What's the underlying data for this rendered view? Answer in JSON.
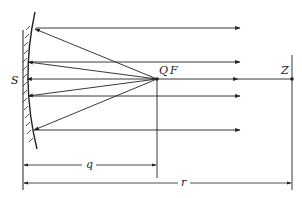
{
  "diagram": {
    "labels": {
      "mirror": "S",
      "focus_q": "Q",
      "focus_f": "F",
      "point_z": "Z",
      "dim_q": "q",
      "dim_r": "r"
    },
    "colors": {
      "line": "#222222",
      "background": "#ffffff"
    },
    "rays": {
      "count_reflected": 5,
      "ray_y": [
        28,
        62,
        79,
        96,
        130
      ]
    }
  }
}
